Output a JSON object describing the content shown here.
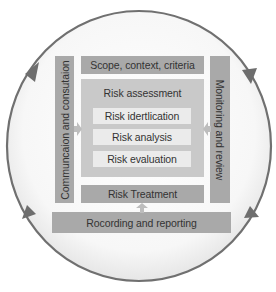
{
  "diagram": {
    "colors": {
      "ring": "#707070",
      "ring_fill": "#f3f3f3",
      "dark_box": "#a9a9a9",
      "mid_box": "#c9c9c9",
      "light_box": "#ebebeb",
      "text": "#333333",
      "arrow": "#bdbdbd"
    },
    "cycle": {
      "direction": "clockwise",
      "arrowheads": [
        "top-left",
        "top-right",
        "bottom-right",
        "bottom-left"
      ]
    },
    "left_bar": {
      "label": "Communcaion and consutaion"
    },
    "right_bar": {
      "label": "Monitoring and review"
    },
    "scope": {
      "label": "Scope, context, criteria"
    },
    "assessment": {
      "title": "Risk assessment",
      "steps": [
        {
          "label": "Risk idertlication"
        },
        {
          "label": "Risk analysis"
        },
        {
          "label": "Risk evaluation"
        }
      ]
    },
    "treatment": {
      "label": "Risk Treatment"
    },
    "recording": {
      "label": "Rocording and reporting"
    },
    "connectors": [
      {
        "from": "left_bar",
        "to": "assessment",
        "direction": "right"
      },
      {
        "from": "right_bar",
        "to": "assessment",
        "direction": "left"
      },
      {
        "from": "recording",
        "to": "treatment",
        "direction": "up"
      }
    ]
  }
}
